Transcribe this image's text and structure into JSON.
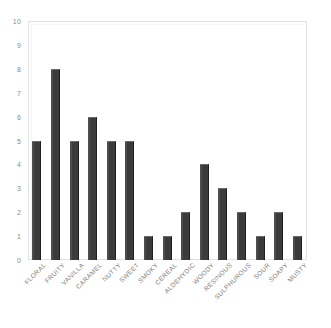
{
  "chart_data": {
    "type": "bar",
    "title": "",
    "subtitle": "",
    "xlabel": "",
    "ylabel": "",
    "ylim": [
      0,
      10
    ],
    "xlim_categories": 16,
    "grid": false,
    "legend": "none",
    "y_ticks": [
      "10",
      "9",
      "8",
      "7",
      "6",
      "5",
      "4",
      "3",
      "2",
      "1",
      "0"
    ],
    "y_tick_values": [
      10,
      9,
      8,
      7,
      6,
      5,
      4,
      3,
      2,
      1,
      0
    ],
    "categories": [
      "FLORAL",
      "FRUITY",
      "VANILLA",
      "CARAMEL",
      "NUTTY",
      "SWEET",
      "SMOKY",
      "CEREAL",
      "ALDEHYDIC",
      "WOODY",
      "RESINOUS",
      "SULPHUROUS",
      "SOUR",
      "SOAPY",
      "MUSTY"
    ],
    "values": [
      5,
      8,
      5,
      6,
      5,
      5,
      1,
      1,
      2,
      4,
      3,
      2,
      1,
      2,
      1
    ],
    "bar_color": "#3b3b3b",
    "axis_color": "#e2e2e2",
    "tick_label_color": "#8a8a8a",
    "category_label_color": "#7e7e7e",
    "background_color": "#ffffff",
    "x_label_rotation_deg": 45
  }
}
